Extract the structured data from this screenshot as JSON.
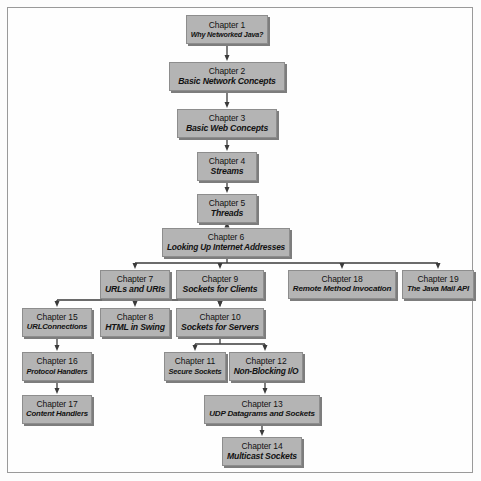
{
  "diagram": {
    "type": "flowchart",
    "box_fill_color": "#b4b4b4",
    "box_border_color": "#8d8d8d",
    "shadow_color": "#7d7d7d",
    "line_color": "#3a3a3a",
    "frame_color": "#9a9a9a",
    "background_color": "#fefefe",
    "nodes": [
      {
        "id": "ch1",
        "chapter": "Chapter 1",
        "title": "Why Networked Java?",
        "x": 186,
        "y": 15,
        "w": 82,
        "h": 29
      },
      {
        "id": "ch2",
        "chapter": "Chapter 2",
        "title": "Basic Network Concepts",
        "x": 169,
        "y": 62,
        "w": 116,
        "h": 29
      },
      {
        "id": "ch3",
        "chapter": "Chapter 3",
        "title": "Basic Web Concepts",
        "x": 177,
        "y": 109,
        "w": 100,
        "h": 29
      },
      {
        "id": "ch4",
        "chapter": "Chapter 4",
        "title": "Streams",
        "x": 197,
        "y": 152,
        "w": 60,
        "h": 29
      },
      {
        "id": "ch5",
        "chapter": "Chapter 5",
        "title": "Threads",
        "x": 197,
        "y": 194,
        "w": 60,
        "h": 29
      },
      {
        "id": "ch6",
        "chapter": "Chapter 6",
        "title": "Looking Up Internet Addresses",
        "x": 162,
        "y": 228,
        "w": 128,
        "h": 29
      },
      {
        "id": "ch7",
        "chapter": "Chapter 7",
        "title": "URLs and URIs",
        "x": 100,
        "y": 270,
        "w": 70,
        "h": 29
      },
      {
        "id": "ch9",
        "chapter": "Chapter 9",
        "title": "Sockets for Clients",
        "x": 176,
        "y": 270,
        "w": 88,
        "h": 29
      },
      {
        "id": "ch18",
        "chapter": "Chapter 18",
        "title": "Remote Method Invocation",
        "x": 288,
        "y": 270,
        "w": 108,
        "h": 29
      },
      {
        "id": "ch19",
        "chapter": "Chapter 19",
        "title": "The Java Mail API",
        "x": 402,
        "y": 270,
        "w": 72,
        "h": 29
      },
      {
        "id": "ch15",
        "chapter": "Chapter 15",
        "title": "URLConnections",
        "x": 22,
        "y": 308,
        "w": 70,
        "h": 29
      },
      {
        "id": "ch8",
        "chapter": "Chapter 8",
        "title": "HTML in Swing",
        "x": 100,
        "y": 308,
        "w": 70,
        "h": 29
      },
      {
        "id": "ch10",
        "chapter": "Chapter 10",
        "title": "Sockets for Servers",
        "x": 176,
        "y": 308,
        "w": 88,
        "h": 29
      },
      {
        "id": "ch16",
        "chapter": "Chapter 16",
        "title": "Protocol Handlers",
        "x": 22,
        "y": 352,
        "w": 70,
        "h": 29
      },
      {
        "id": "ch11",
        "chapter": "Chapter 11",
        "title": "Secure Sockets",
        "x": 164,
        "y": 352,
        "w": 62,
        "h": 29
      },
      {
        "id": "ch12",
        "chapter": "Chapter 12",
        "title": "Non-Blocking I/O",
        "x": 229,
        "y": 352,
        "w": 74,
        "h": 29
      },
      {
        "id": "ch17",
        "chapter": "Chapter 17",
        "title": "Content Handlers",
        "x": 22,
        "y": 395,
        "w": 70,
        "h": 29
      },
      {
        "id": "ch13",
        "chapter": "Chapter 13",
        "title": "UDP Datagrams and Sockets",
        "x": 204,
        "y": 395,
        "w": 116,
        "h": 29
      },
      {
        "id": "ch14",
        "chapter": "Chapter 14",
        "title": "Multicast Sockets",
        "x": 222,
        "y": 437,
        "w": 80,
        "h": 29
      }
    ],
    "edges": [
      {
        "from": "ch1",
        "to": "ch2"
      },
      {
        "from": "ch2",
        "to": "ch3"
      },
      {
        "from": "ch3",
        "to": "ch4"
      },
      {
        "from": "ch4",
        "to": "ch5"
      },
      {
        "from": "ch5",
        "to": "ch6"
      },
      {
        "from": "ch6",
        "to": "ch7"
      },
      {
        "from": "ch6",
        "to": "ch9"
      },
      {
        "from": "ch6",
        "to": "ch18"
      },
      {
        "from": "ch6",
        "to": "ch19"
      },
      {
        "from": "ch7",
        "to": "ch15"
      },
      {
        "from": "ch7",
        "to": "ch8"
      },
      {
        "from": "ch7",
        "to": "ch10"
      },
      {
        "from": "ch9",
        "to": "ch10"
      },
      {
        "from": "ch15",
        "to": "ch16"
      },
      {
        "from": "ch16",
        "to": "ch17"
      },
      {
        "from": "ch10",
        "to": "ch11"
      },
      {
        "from": "ch10",
        "to": "ch12"
      },
      {
        "from": "ch12",
        "to": "ch13"
      },
      {
        "from": "ch13",
        "to": "ch14"
      }
    ]
  }
}
